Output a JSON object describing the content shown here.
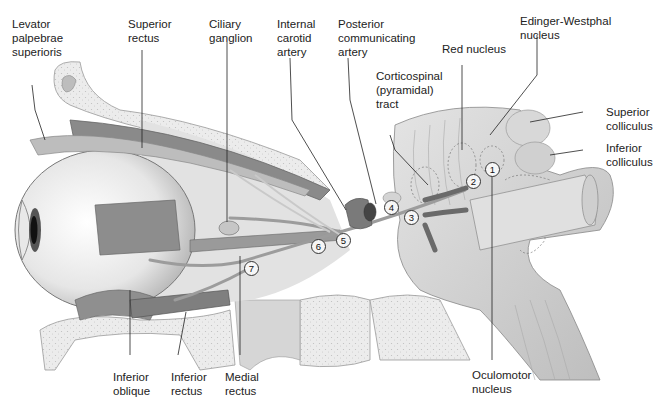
{
  "figure": {
    "labels": {
      "levator": "Levator\npalpebrae\nsuperioris",
      "superior_rectus": "Superior\nrectus",
      "ciliary_ganglion": "Ciliary\nganglion",
      "internal_carotid": "Internal\ncarotid\nartery",
      "posterior_communicating": "Posterior\ncommunicating\nartery",
      "red_nucleus": "Red nucleus",
      "edinger_westphal": "Edinger-Westphal\nnucleus",
      "corticospinal": "Corticospinal\n(pyramidal)\ntract",
      "superior_colliculus": "Superior\ncolliculus",
      "inferior_colliculus": "Inferior\ncolliculus",
      "inferior_oblique": "Inferior\noblique",
      "inferior_rectus": "Inferior\nrectus",
      "medial_rectus": "Medial\nrectus",
      "oculomotor_nucleus": "Oculomotor\nnucleus"
    },
    "markers": [
      "1",
      "2",
      "3",
      "4",
      "5",
      "6",
      "7"
    ]
  }
}
